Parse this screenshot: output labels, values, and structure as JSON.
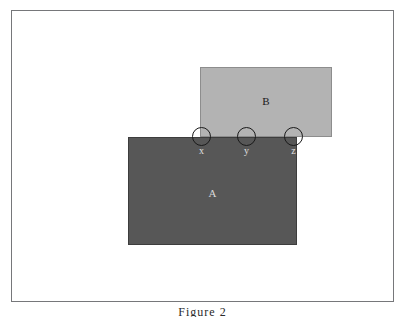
{
  "figure": {
    "caption": "Figure 2",
    "frame": {
      "border_color": "#76777a",
      "background_color": "#ffffff"
    },
    "shapes": [
      {
        "id": "rect-b",
        "label": "B",
        "fill_color": "#b3b3b3",
        "stroke_color": "#8d8d8d",
        "x": 188,
        "y": 56,
        "width": 132,
        "height": 70
      },
      {
        "id": "rect-a",
        "label": "A",
        "fill_color": "#575757",
        "stroke_color": "#3d3d3d",
        "x": 116,
        "y": 126,
        "width": 169,
        "height": 108
      }
    ],
    "nodes": [
      {
        "id": "node-x",
        "label": "x",
        "cx": 189,
        "cy": 126,
        "radius": 9.5,
        "stroke_color": "#1a1a1a"
      },
      {
        "id": "node-y",
        "label": "y",
        "cx": 234,
        "cy": 126,
        "radius": 9.5,
        "stroke_color": "#1a1a1a"
      },
      {
        "id": "node-z",
        "label": "z",
        "cx": 281,
        "cy": 126,
        "radius": 9.5,
        "stroke_color": "#1a1a1a"
      }
    ]
  }
}
